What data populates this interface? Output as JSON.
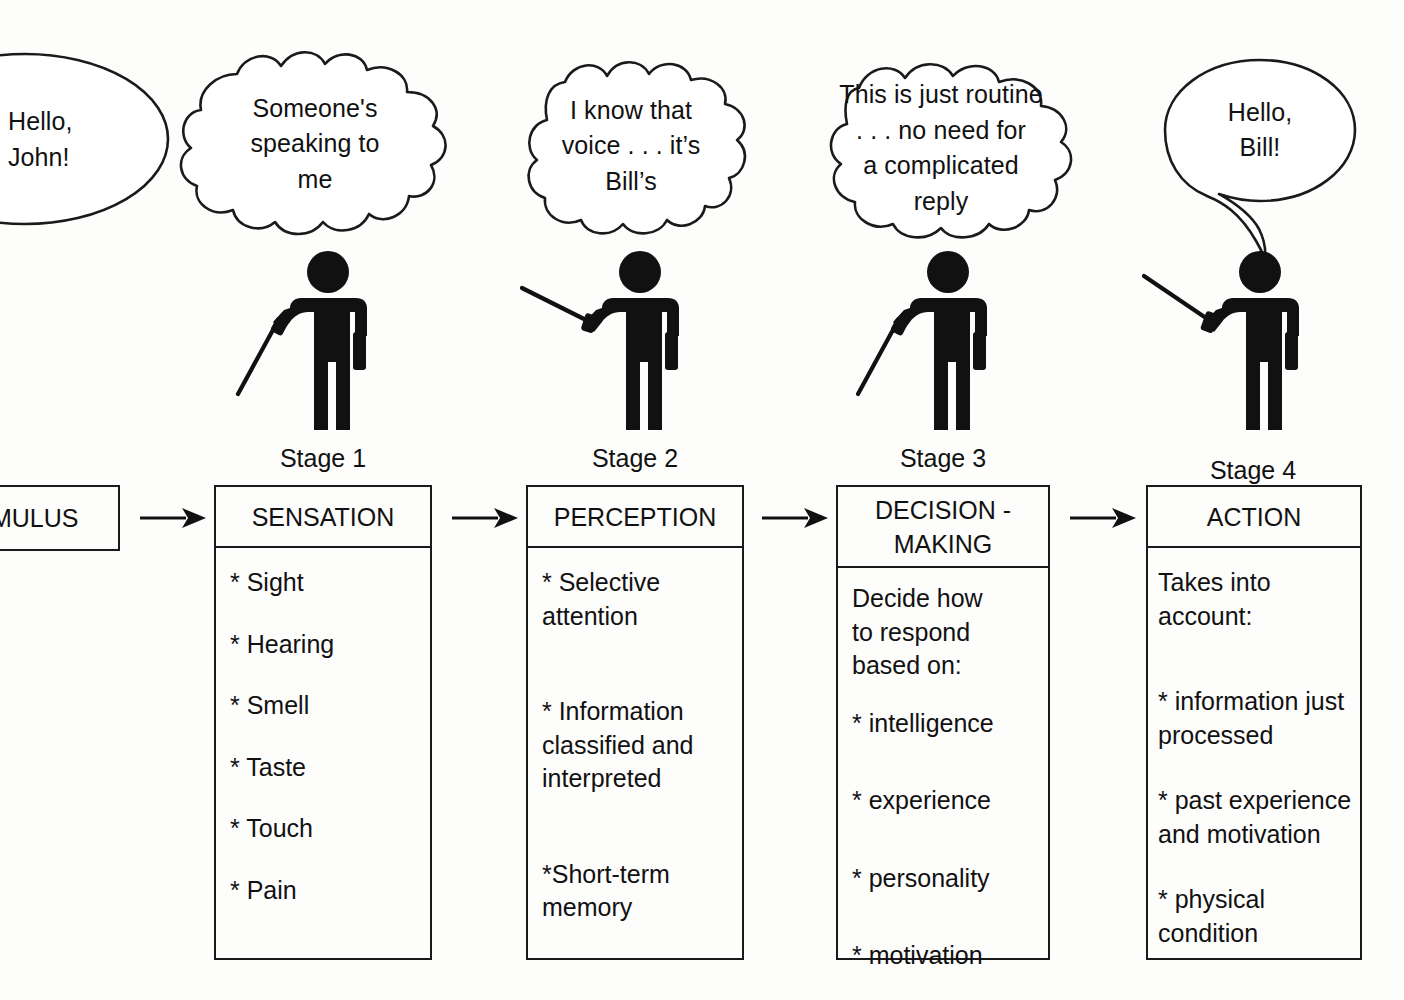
{
  "bubbles": [
    {
      "name": "speech-bubble-hello-john",
      "shape": "ellipse",
      "text": "Hello,\nJohn!"
    },
    {
      "name": "thought-bubble-stage-1",
      "shape": "cloud",
      "text": "Someone's\nspeaking to\nme"
    },
    {
      "name": "thought-bubble-stage-2",
      "shape": "cloud",
      "text": "I know that\nvoice . . . it’s\nBill’s"
    },
    {
      "name": "thought-bubble-stage-3",
      "shape": "cloud",
      "text": "This is just routine\n. . . no need for\na complicated\nreply"
    },
    {
      "name": "speech-bubble-hello-bill",
      "shape": "ellipse-tail",
      "text": "Hello,\nBill!"
    }
  ],
  "stage_labels": [
    "Stage 1",
    "Stage 2",
    "Stage 3",
    "Stage 4"
  ],
  "stimulus": {
    "label": "STIMULUS"
  },
  "boxes": [
    {
      "header": "SENSATION",
      "items": [
        "* Sight",
        "* Hearing",
        "* Smell",
        "* Taste",
        "* Touch",
        "* Pain"
      ]
    },
    {
      "header": "PERCEPTION",
      "items": [
        "* Selective\n   attention",
        "* Information\n   classified and\n   interpreted",
        "*Short-term\n  memory"
      ]
    },
    {
      "header": "DECISION -\nMAKING",
      "items": [
        "Decide how\nto respond\nbased on:",
        "* intelligence",
        "* experience",
        "* personality",
        "* motivation"
      ]
    },
    {
      "header": "ACTION",
      "items": [
        "Takes into\naccount:",
        "* information just\n   processed",
        "* past experience\n   and motivation",
        "* physical\n   condition"
      ]
    }
  ],
  "colors": {
    "ink": "#1a1a1a",
    "paper": "#fdfdfc"
  }
}
